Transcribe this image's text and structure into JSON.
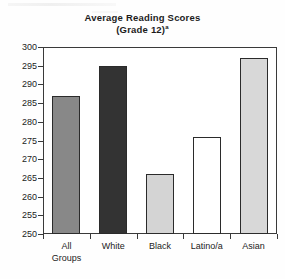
{
  "chart_data": {
    "type": "bar",
    "title": "Average Reading Scores",
    "subtitle": "(Grade 12)",
    "title_footnote_marker": "a",
    "xlabel": "",
    "ylabel": "",
    "categories": [
      "All Groups",
      "White",
      "Black",
      "Latino/a",
      "Asian"
    ],
    "values": [
      287,
      295,
      266,
      276,
      297
    ],
    "ylim": [
      250,
      300
    ],
    "yticks": [
      250,
      255,
      260,
      265,
      270,
      275,
      280,
      285,
      290,
      295,
      300
    ],
    "ytick_labels": [
      "250",
      "255",
      "260",
      "265",
      "270",
      "275",
      "280",
      "285",
      "290",
      "295",
      "300"
    ],
    "grid": false,
    "legend": false,
    "bar_colors": [
      "#888888",
      "#333333",
      "#d4d4d4",
      "#ffffff",
      "#d8d8d8"
    ],
    "bar_edge_color": "#2b2b2b",
    "frame_color": "#3a3a3a",
    "text_color": "#1c1c1c",
    "category_lines": [
      [
        "All",
        "Groups"
      ],
      [
        "White",
        ""
      ],
      [
        "Black",
        ""
      ],
      [
        "Latino/a",
        ""
      ],
      [
        "Asian",
        ""
      ]
    ]
  },
  "axis": {
    "y_labels": [
      "300",
      "295",
      "290",
      "285",
      "280",
      "275",
      "270",
      "265",
      "260",
      "255",
      "250"
    ]
  }
}
